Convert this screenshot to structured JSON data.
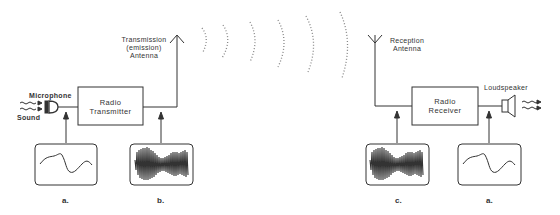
{
  "diagram": {
    "type": "radio transmission block diagram",
    "transmitter": {
      "input_label": "Sound",
      "microphone_label": "Microphone",
      "block_label_line1": "Radio",
      "block_label_line2": "Transmitter",
      "antenna_label_line1": "Transmission",
      "antenna_label_line2": "(emission)",
      "antenna_label_line3": "Antenna"
    },
    "receiver": {
      "antenna_label_line1": "Reception",
      "antenna_label_line2": "Antenna",
      "block_label_line1": "Radio",
      "block_label_line2": "Receiver",
      "speaker_label": "Loudspeaker"
    },
    "scopes": [
      {
        "id": "a1",
        "caption": "a.",
        "signal": "audio waveform"
      },
      {
        "id": "b",
        "caption": "b.",
        "signal": "modulated carrier"
      },
      {
        "id": "c",
        "caption": "c.",
        "signal": "modulated carrier"
      },
      {
        "id": "a2",
        "caption": "a.",
        "signal": "audio waveform"
      }
    ],
    "colors": {
      "line": "#333333",
      "wave": "#888888"
    }
  }
}
